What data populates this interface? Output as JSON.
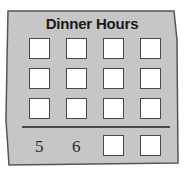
{
  "card": {
    "title": "Dinner Hours",
    "background_color": "#c4c4c4",
    "border_color": "#555555"
  },
  "grid": {
    "rows": [
      [
        "",
        "",
        "",
        ""
      ],
      [
        "",
        "",
        "",
        ""
      ],
      [
        "",
        "",
        "",
        ""
      ]
    ]
  },
  "answer_row": {
    "cells": [
      "5",
      "6",
      "",
      ""
    ]
  }
}
